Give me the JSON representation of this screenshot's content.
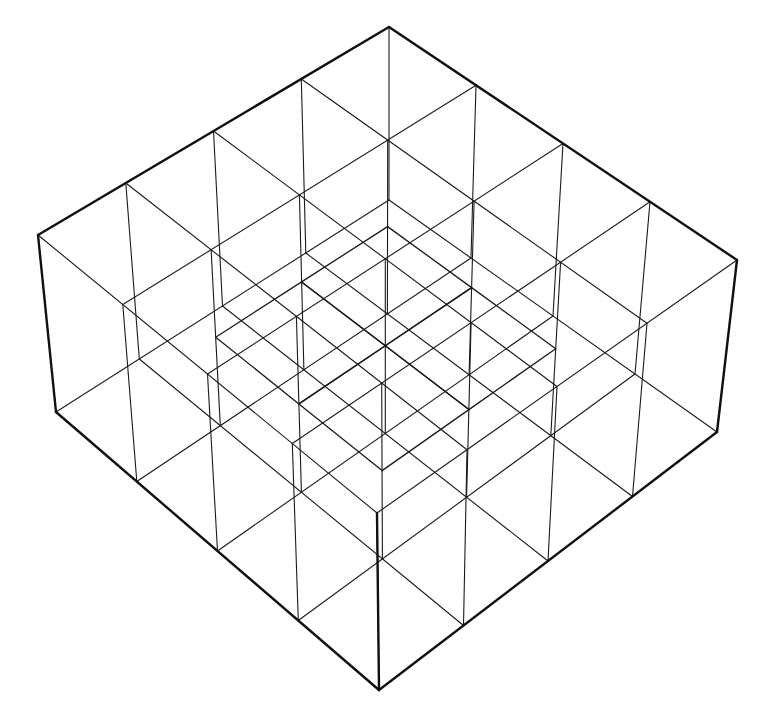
{
  "drawing": {
    "title": "",
    "description_visible": "",
    "stroke_color": "#1a1a1a",
    "background": "#ffffff",
    "grid_cells": 4,
    "top_plane": {
      "back": [
        389,
        27
      ],
      "left": [
        38,
        235
      ],
      "right": [
        737,
        260
      ],
      "front": [
        377,
        513
      ]
    },
    "bottom_plane": {
      "back": [
        389,
        200
      ],
      "left": [
        56,
        412
      ],
      "right": [
        717,
        432
      ],
      "front": [
        379,
        690
      ]
    },
    "mid_plane": {
      "back": [
        389,
        113
      ],
      "left": [
        47,
        323
      ],
      "right": [
        727,
        346
      ],
      "front": [
        378,
        601
      ]
    },
    "mid_plane_cells": [
      [
        1,
        1
      ],
      [
        1,
        2
      ],
      [
        2,
        1
      ],
      [
        2,
        2
      ]
    ],
    "outer_edges": [
      [
        [
          389,
          27
        ],
        [
          38,
          235
        ]
      ],
      [
        [
          389,
          27
        ],
        [
          737,
          260
        ]
      ],
      [
        [
          38,
          235
        ],
        [
          56,
          412
        ]
      ],
      [
        [
          737,
          260
        ],
        [
          717,
          432
        ]
      ],
      [
        [
          56,
          412
        ],
        [
          379,
          690
        ]
      ],
      [
        [
          717,
          432
        ],
        [
          379,
          690
        ]
      ],
      [
        [
          377,
          513
        ],
        [
          379,
          690
        ]
      ]
    ]
  }
}
